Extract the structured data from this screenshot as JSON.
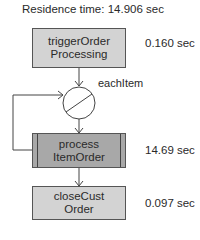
{
  "header": {
    "residence_time_label": "Residence time: 14.906 sec"
  },
  "nodes": [
    {
      "id": "triggerOrderProcessing",
      "line1": "triggerOrder",
      "line2": "Processing",
      "time": "0.160 sec",
      "fill": "#d3d3d3"
    },
    {
      "id": "processItemOrder",
      "line1": "process",
      "line2": "ItemOrder",
      "time": "14.69 sec",
      "fill": "#a8a8a8"
    },
    {
      "id": "closeCustOrder",
      "line1": "closeCust",
      "line2": "Order",
      "time": "0.097 sec",
      "fill": "#d3d3d3"
    }
  ],
  "loop": {
    "label": "eachItem"
  }
}
